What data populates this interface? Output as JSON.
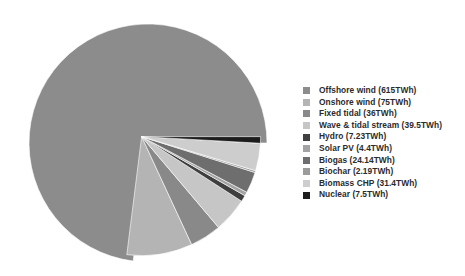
{
  "chart_data": {
    "type": "pie",
    "title": "",
    "subtitle": "",
    "xlabel": "",
    "ylabel": "",
    "units": "TWh",
    "grid": false,
    "legend_position": "right",
    "start_angle_deg": 0,
    "direction": "counterclockwise",
    "explode_group": "all slices except Offshore wind",
    "total": 842.36,
    "categories": [
      "Offshore wind",
      "Onshore wind",
      "Fixed tidal",
      "Wave & tidal stream",
      "Hydro",
      "Solar PV",
      "Biogas",
      "Biochar",
      "Biomass CHP",
      "Nuclear"
    ],
    "values": [
      615,
      75,
      36,
      39.5,
      7.23,
      4.4,
      24.14,
      2.19,
      31.4,
      7.5
    ],
    "colors": [
      "#8c8c8c",
      "#b4b4b4",
      "#898989",
      "#c6c6c6",
      "#3f3f3f",
      "#a3a3a3",
      "#6e6e6e",
      "#9b9b9b",
      "#cdcdcd",
      "#1c1c1c"
    ],
    "slices": [
      {
        "label": "Offshore wind",
        "value": 615,
        "display": "Offshore wind (615TWh)",
        "color": "#8c8c8c",
        "exploded": false
      },
      {
        "label": "Onshore wind",
        "value": 75,
        "display": "Onshore wind (75TWh)",
        "color": "#b4b4b4",
        "exploded": true
      },
      {
        "label": "Fixed tidal",
        "value": 36,
        "display": "Fixed tidal (36TWh)",
        "color": "#898989",
        "exploded": true
      },
      {
        "label": "Wave & tidal stream",
        "value": 39.5,
        "display": "Wave & tidal stream (39.5TWh)",
        "color": "#c6c6c6",
        "exploded": true
      },
      {
        "label": "Hydro",
        "value": 7.23,
        "display": "Hydro (7.23TWh)",
        "color": "#3f3f3f",
        "exploded": true
      },
      {
        "label": "Solar PV",
        "value": 4.4,
        "display": "Solar PV (4.4TWh)",
        "color": "#a3a3a3",
        "exploded": true
      },
      {
        "label": "Biogas",
        "value": 24.14,
        "display": "Biogas (24.14TWh)",
        "color": "#6e6e6e",
        "exploded": true
      },
      {
        "label": "Biochar",
        "value": 2.19,
        "display": "Biochar (2.19TWh)",
        "color": "#9b9b9b",
        "exploded": true
      },
      {
        "label": "Biomass CHP",
        "value": 31.4,
        "display": "Biomass CHP (31.4TWh)",
        "color": "#cdcdcd",
        "exploded": true
      },
      {
        "label": "Nuclear",
        "value": 7.5,
        "display": "Nuclear (7.5TWh)",
        "color": "#1c1c1c",
        "exploded": true
      }
    ]
  },
  "legend": {
    "items": [
      {
        "label": "Offshore wind (615TWh)",
        "color": "#8c8c8c"
      },
      {
        "label": "Onshore wind (75TWh)",
        "color": "#b4b4b4"
      },
      {
        "label": "Fixed tidal (36TWh)",
        "color": "#898989"
      },
      {
        "label": "Wave & tidal stream (39.5TWh)",
        "color": "#c6c6c6"
      },
      {
        "label": "Hydro (7.23TWh)",
        "color": "#3f3f3f"
      },
      {
        "label": "Solar PV (4.4TWh)",
        "color": "#a3a3a3"
      },
      {
        "label": "Biogas (24.14TWh)",
        "color": "#6e6e6e"
      },
      {
        "label": "Biochar (2.19TWh)",
        "color": "#9b9b9b"
      },
      {
        "label": "Biomass CHP (31.4TWh)",
        "color": "#cdcdcd"
      },
      {
        "label": "Nuclear (7.5TWh)",
        "color": "#1c1c1c"
      }
    ]
  },
  "geometry": {
    "center_x": 148,
    "center_y": 143,
    "radius": 119,
    "explode_offset": 9,
    "explode_direction_deg": 135
  },
  "background_color": "#ffffff"
}
